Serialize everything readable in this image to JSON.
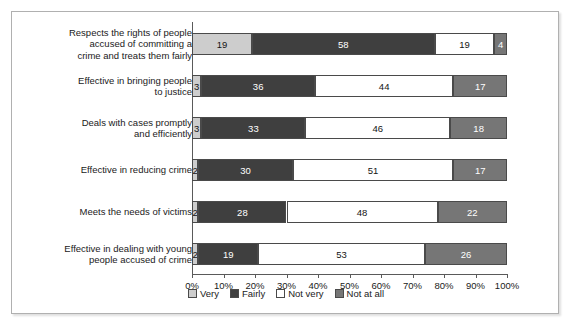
{
  "chart_data": {
    "type": "bar",
    "subtype": "100% stacked horizontal bar",
    "title": "",
    "xlabel": "",
    "ylabel": "",
    "xlim": [
      0,
      100
    ],
    "grid": false,
    "legend_position": "bottom-center",
    "categories": [
      "Respects the rights of people\naccused of committing a\ncrime and treats them fairly",
      "Effective in bringing people\nto justice",
      "Deals with cases promptly\nand efficiently",
      "Effective in reducing crime",
      "Meets the needs of victims",
      "Effective in dealing with young\npeople accused of crime"
    ],
    "series": [
      {
        "name": "Very",
        "color": "#cdcdcd",
        "values": [
          19,
          3,
          3,
          2,
          2,
          2
        ]
      },
      {
        "name": "Fairly",
        "color": "#3f3f3f",
        "values": [
          58,
          36,
          33,
          30,
          28,
          19
        ]
      },
      {
        "name": "Not very",
        "color": "#ffffff",
        "values": [
          19,
          44,
          46,
          51,
          48,
          53
        ]
      },
      {
        "name": "Not at all",
        "color": "#767676",
        "values": [
          4,
          17,
          18,
          17,
          22,
          26
        ]
      }
    ],
    "xticks": [
      0,
      10,
      20,
      30,
      40,
      50,
      60,
      70,
      80,
      90,
      100
    ],
    "xticklabels": [
      "0%",
      "10%",
      "20%",
      "30%",
      "40%",
      "50%",
      "60%",
      "70%",
      "80%",
      "90%",
      "100%"
    ]
  },
  "legend": {
    "items": [
      {
        "label": "Very",
        "swatch": "very"
      },
      {
        "label": "Fairly",
        "swatch": "fairly"
      },
      {
        "label": "Not very",
        "swatch": "notvery"
      },
      {
        "label": "Not at all",
        "swatch": "notatall"
      }
    ]
  }
}
